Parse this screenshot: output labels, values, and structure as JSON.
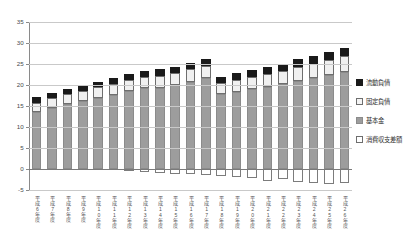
{
  "chart_data": {
    "type": "bar",
    "stacked": true,
    "title": "",
    "xlabel": "",
    "ylabel": "",
    "ylim": [
      -5,
      35
    ],
    "yticks": [
      -5,
      0,
      5,
      10,
      15,
      20,
      25,
      30,
      35
    ],
    "ytick_labels": [
      "-5",
      "0",
      "5",
      "10",
      "15",
      "20",
      "25",
      "30",
      "35"
    ],
    "grid": true,
    "legend_position": "right",
    "categories": [
      "平成6年度",
      "平成7年度",
      "平成8年度",
      "平成9年度",
      "平成10年度",
      "平成11年度",
      "平成12年度",
      "平成13年度",
      "平成14年度",
      "平成15年度",
      "平成16年度",
      "平成17年度",
      "平成18年度",
      "平成19年度",
      "平成20年度",
      "平成21年度",
      "平成22年度",
      "平成23年度",
      "平成24年度",
      "平成25年度",
      "平成26年度"
    ],
    "series": [
      {
        "name": "基本金",
        "color": "#9d9d9d",
        "values": [
          13.6,
          14.5,
          15.4,
          16.1,
          16.9,
          17.7,
          18.5,
          19.2,
          19.4,
          20.0,
          20.8,
          21.6,
          17.8,
          18.4,
          19.0,
          19.6,
          20.2,
          21.0,
          21.7,
          22.3,
          23.0
        ]
      },
      {
        "name": "固定負債",
        "color": "#f0f0f0",
        "values": [
          2.2,
          2.3,
          2.4,
          2.5,
          2.6,
          2.6,
          2.7,
          2.7,
          2.8,
          2.9,
          2.9,
          2.9,
          2.7,
          2.8,
          2.9,
          3.0,
          3.2,
          3.3,
          3.4,
          3.6,
          3.8
        ]
      },
      {
        "name": "流動負債",
        "color": "#1a1a1a",
        "values": [
          1.3,
          1.3,
          1.3,
          1.3,
          1.3,
          1.4,
          1.4,
          1.4,
          1.5,
          1.5,
          1.6,
          1.6,
          1.5,
          1.6,
          1.6,
          1.7,
          1.7,
          1.8,
          1.8,
          1.9,
          2.0
        ]
      },
      {
        "name": "消費収支差額",
        "color": "#ffffff",
        "values": [
          0,
          0,
          0,
          0,
          0,
          0,
          -0.4,
          -0.7,
          -1.0,
          -1.2,
          -1.3,
          -1.5,
          -1.6,
          -1.8,
          -2.1,
          -2.8,
          -2.4,
          -3.1,
          -3.3,
          -3.6,
          -3.4
        ]
      }
    ],
    "totals": [
      17.1,
      18.1,
      19.1,
      19.9,
      20.8,
      21.7,
      22.6,
      23.3,
      23.7,
      24.4,
      25.3,
      26.1,
      22.0,
      22.8,
      23.5,
      24.3,
      25.1,
      26.1,
      26.9,
      27.8,
      28.8
    ]
  },
  "legend": {
    "items": [
      {
        "label": "流動負債",
        "swatch": "black-square-swatch"
      },
      {
        "label": "固定負債",
        "swatch": "light-square-swatch"
      },
      {
        "label": "基本金",
        "swatch": "gray-square-swatch"
      },
      {
        "label": "消費収支差額",
        "swatch": "white-square-swatch"
      }
    ]
  }
}
